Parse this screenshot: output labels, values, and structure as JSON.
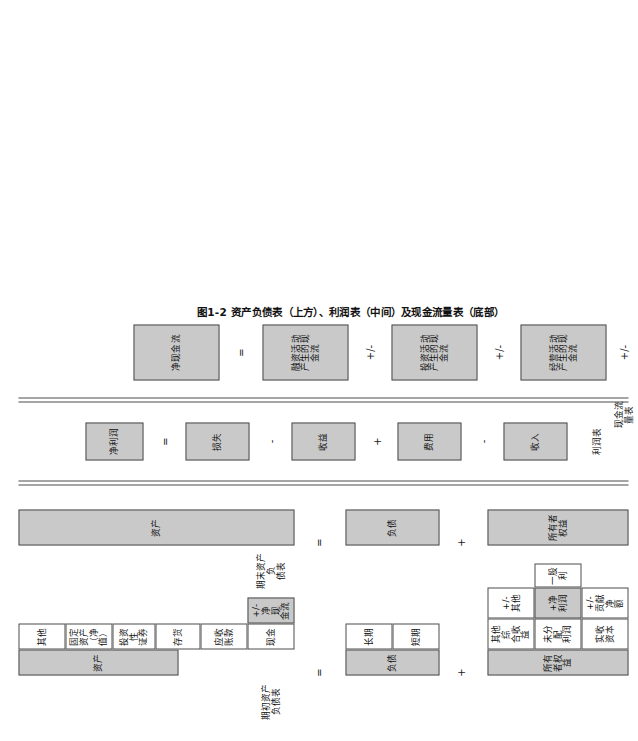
{
  "figure": {
    "caption": "图1-2  资产负债表（上方）、利润表（中间）及现金流量表（底部）",
    "colors": {
      "fill": "#c9c9c9",
      "stroke": "#4d4d4d",
      "page": "#ffffff"
    }
  },
  "row_labels": {
    "beginning_balance_sheet": "期初资产\n负债表",
    "beginning_balance_sheet_l1": "期初资产",
    "beginning_balance_sheet_l2": "负债表",
    "ending_balance_sheet_l1": "期末资产负",
    "ending_balance_sheet_l2": "债表",
    "income_statement": "利润表",
    "cash_flow_statement_l1": "现金流",
    "cash_flow_statement_l2": "量表"
  },
  "row1_beginning_balance_sheet": {
    "assets_header": "资产",
    "asset_items": [
      "现金",
      "应收\n账款",
      "存货",
      "投资性\n证券",
      "固定资产\n（净值）",
      "其他"
    ],
    "asset_items_flat": [
      "现金",
      "应收账款",
      "存货",
      "投资性证券",
      "固定资产（净值）",
      "其他"
    ],
    "cash_delta": "+/-净现\n金流",
    "liabilities_header": "负债",
    "liability_items": [
      "短期",
      "长期"
    ],
    "equity_header": "所有者权益",
    "equity_items": [
      "实收\n资本",
      "未分配\n利润",
      "其他综\n合收益"
    ],
    "equity_items_flat": [
      "实收资本",
      "未分配利润",
      "其他综合收益"
    ],
    "equity_deltas": [
      "+/-贡\n献净额",
      "+净\n利润",
      "+/-\n其他"
    ],
    "equity_deltas_flat": [
      "+/-贡献净额",
      "+净利润",
      "+/-其他"
    ],
    "dividend": "一股利",
    "op_assets_eq_liab": "=",
    "op_liab_plus_equity": "+"
  },
  "row2_ending_balance_sheet": {
    "assets_header": "资产",
    "liabilities_header": "负债",
    "equity_header": "所有者权益",
    "op_assets_eq_liab": "=",
    "op_liab_plus_equity": "+"
  },
  "row3_income_statement": {
    "items": [
      "收入",
      "费用",
      "收益",
      "损失",
      "净利润"
    ],
    "operators": [
      "-",
      "+",
      "-",
      "="
    ]
  },
  "row4_cash_flow_statement": {
    "items": [
      "经营活动\n产生的现\n金流",
      "投资活动\n产生的现\n金流",
      "融资活动\n产生的现\n金流",
      "净现金流"
    ],
    "items_flat": [
      "经营活动产生的现金流",
      "投资活动产生的现金流",
      "融资活动产生的现金流",
      "净现金流"
    ],
    "lead_operator": "+/-",
    "operators": [
      "+/-",
      "+/-",
      "="
    ]
  }
}
